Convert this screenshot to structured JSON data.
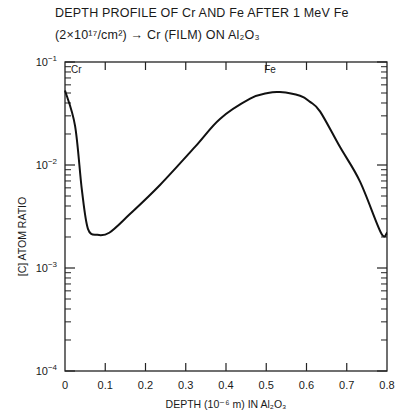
{
  "title_line1": "DEPTH PROFILE OF Cr AND Fe AFTER 1 MeV Fe",
  "title_line2": "(2×10¹⁷/cm²) → Cr (FILM) ON Al₂O₃",
  "chart_data": {
    "type": "line",
    "xlabel": "DEPTH (10^-6 m) IN Al2O3",
    "ylabel": "[C] ATOM RATIO",
    "xlim": [
      0,
      0.8
    ],
    "ylim": [
      0.0001,
      0.1
    ],
    "yscale": "log",
    "grid": false,
    "legend": null,
    "x_ticks": [
      "0",
      "0.1",
      "0.2",
      "0.3",
      "0.4",
      "0.5",
      "0.6",
      "0.7",
      "0.8"
    ],
    "y_ticks": [
      "10^-4",
      "10^-3",
      "10^-2",
      "10^-1"
    ],
    "annotations": [
      {
        "text": "Cr",
        "x": 0.01,
        "y": 0.085
      },
      {
        "text": "Fe",
        "x": 0.49,
        "y": 0.085
      }
    ],
    "series": [
      {
        "name": "[C] atom ratio",
        "x": [
          0.0,
          0.025,
          0.042,
          0.057,
          0.08,
          0.11,
          0.16,
          0.236,
          0.323,
          0.385,
          0.46,
          0.504,
          0.534,
          0.584,
          0.609,
          0.634,
          0.683,
          0.733,
          0.785,
          0.8
        ],
        "y": [
          0.053,
          0.024,
          0.0057,
          0.0024,
          0.0021,
          0.0022,
          0.0033,
          0.0064,
          0.015,
          0.028,
          0.044,
          0.05,
          0.051,
          0.047,
          0.041,
          0.033,
          0.015,
          0.0069,
          0.0022,
          0.0022
        ]
      }
    ]
  }
}
